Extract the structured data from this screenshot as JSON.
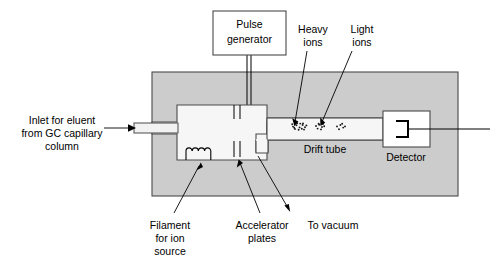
{
  "figure": {
    "background_color": "#ffffff",
    "chamber_fill": "#cccccc",
    "tube_fill": "#f2f2f2",
    "outline_color": "#4a4a4a",
    "text_color": "#000000"
  },
  "boxes": {
    "pulse_generator": {
      "line1": "Pulse",
      "line2": "generator"
    },
    "detector": {
      "label": "Detector"
    },
    "drift_tube": {
      "label": "Drift tube"
    }
  },
  "labels": {
    "inlet": {
      "line1": "Inlet for eluent",
      "line2": "from GC capillary",
      "line3": "column"
    },
    "filament": {
      "line1": "Filament",
      "line2": "for ion",
      "line3": "source"
    },
    "accelerator": {
      "line1": "Accelerator",
      "line2": "plates"
    },
    "vacuum": {
      "line1": "To vacuum"
    },
    "heavy_ions": {
      "line1": "Heavy",
      "line2": "ions"
    },
    "light_ions": {
      "line1": "Light",
      "line2": "ions"
    }
  },
  "ion_clusters": [
    {
      "name": "heavy-ion-packet",
      "dots": [
        [
          293.0,
          126.6
        ],
        [
          296.4,
          125.2
        ],
        [
          299.6,
          127.4
        ],
        [
          302.6,
          125.0
        ],
        [
          295.0,
          129.0
        ],
        [
          298.6,
          129.8
        ],
        [
          301.8,
          128.8
        ],
        [
          305.0,
          127.2
        ],
        [
          292.2,
          124.2
        ],
        [
          304.0,
          129.6
        ],
        [
          300.2,
          123.6
        ],
        [
          297.2,
          123.2
        ],
        [
          306.4,
          125.4
        ],
        [
          294.2,
          127.8
        ],
        [
          303.0,
          123.4
        ]
      ]
    },
    {
      "name": "medium-ion-packet",
      "dots": [
        [
          316.0,
          126.0
        ],
        [
          319.2,
          124.8
        ],
        [
          322.0,
          127.0
        ],
        [
          317.6,
          128.6
        ],
        [
          321.0,
          129.4
        ],
        [
          324.2,
          126.2
        ],
        [
          318.6,
          123.8
        ],
        [
          323.0,
          124.0
        ]
      ]
    },
    {
      "name": "light-ion-packet",
      "dots": [
        [
          337.0,
          126.4
        ],
        [
          340.4,
          125.0
        ],
        [
          343.2,
          127.6
        ],
        [
          339.0,
          129.2
        ],
        [
          342.2,
          123.8
        ],
        [
          345.0,
          126.4
        ]
      ]
    }
  ]
}
